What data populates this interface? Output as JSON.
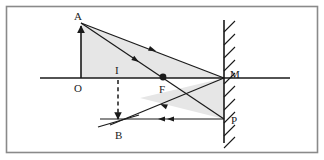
{
  "figure": {
    "canvas": {
      "width": 324,
      "height": 160
    },
    "border": {
      "color": "#8a8a8a",
      "x": 6,
      "y": 6,
      "width": 312,
      "height": 147
    },
    "stroke_color": "#1a1a1a",
    "shade_color": "#e3e3e3",
    "labels": [
      {
        "id": "A",
        "text": "A",
        "x": 74,
        "y": 20
      },
      {
        "id": "O",
        "text": "O",
        "x": 74,
        "y": 92
      },
      {
        "id": "I",
        "text": "I",
        "x": 115,
        "y": 74
      },
      {
        "id": "F",
        "text": "F",
        "x": 159,
        "y": 93
      },
      {
        "id": "B",
        "text": "B",
        "x": 115,
        "y": 139
      },
      {
        "id": "M",
        "text": "M",
        "x": 230,
        "y": 78
      },
      {
        "id": "P",
        "text": "P",
        "x": 231,
        "y": 124
      }
    ],
    "points": {
      "A": {
        "x": 81,
        "y": 23
      },
      "O": {
        "x": 81,
        "y": 78
      },
      "I": {
        "x": 118,
        "y": 78
      },
      "F": {
        "x": 163,
        "y": 77
      },
      "B": {
        "x": 118,
        "y": 122
      },
      "M": {
        "x": 224,
        "y": 78
      },
      "P": {
        "x": 224,
        "y": 119
      }
    },
    "axis": {
      "y": 78,
      "x1": 40,
      "x2": 290
    },
    "mirror": {
      "x": 224,
      "y1": 20,
      "y2": 143,
      "hatch_side": "right",
      "hatch_count": 10
    },
    "focal_dot": {
      "x": 163,
      "y": 77,
      "r": 3.4
    },
    "object_arrow": {
      "from": "O",
      "to": "A",
      "direction": "up"
    },
    "image_arrow": {
      "from": "I",
      "to": "B",
      "direction": "down",
      "style": "dashed"
    },
    "image_segment": {
      "x1": 98,
      "y1": 127,
      "x2": 139,
      "y2": 115
    },
    "rays": [
      {
        "id": "ray-A-to-M",
        "from": "A",
        "to": "M",
        "arrow_at": 0.52
      },
      {
        "id": "ray-A-to-P",
        "from": "A",
        "to": "P",
        "arrow_at": 0.38
      },
      {
        "id": "ray-M-to-B",
        "from": "M",
        "to": "B",
        "arrow_at": 0.55
      },
      {
        "id": "ray-P-to-B",
        "from": "P",
        "to": "B",
        "arrow_at": 0.52
      }
    ],
    "shaded_regions": [
      {
        "id": "object-triangle",
        "points": "81,23 81,78 224,78"
      },
      {
        "id": "image-triangle",
        "points": "224,78 224,119 140,98"
      }
    ]
  }
}
